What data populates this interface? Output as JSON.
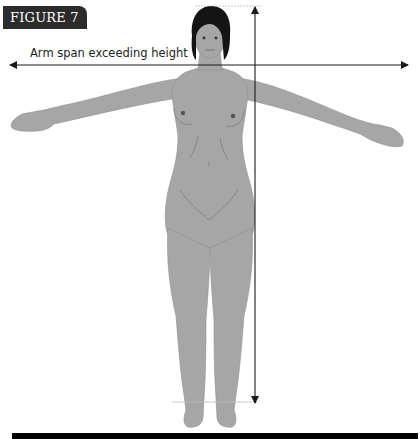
{
  "figure": {
    "label": "FIGURE 7",
    "caption": "Arm span exceeding height",
    "illustration": "female-figure-arms-outstretched",
    "measurements": [
      {
        "name": "arm-span",
        "orientation": "horizontal",
        "description": "double-headed arrow spanning fingertip to fingertip"
      },
      {
        "name": "height",
        "orientation": "vertical",
        "description": "double-headed arrow from top of head to feet"
      }
    ],
    "colors": {
      "label_bg": "#2b2b2b",
      "body_fill": "#a6a6a6",
      "hair": "#141414",
      "arrow": "#1a1a1a",
      "guide_lines": "#bdbdbd",
      "bottom_bar": "#000000"
    }
  }
}
